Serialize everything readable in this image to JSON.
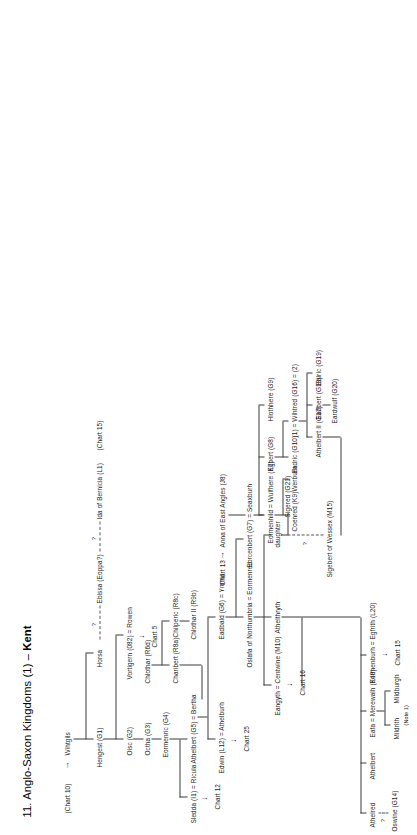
{
  "chart": {
    "title_prefix": "11. Anglo-Saxon Kingdoms (1) – ",
    "title_kingdom": "Kent",
    "full_title": "11. Anglo-Saxon Kingdoms (1) – Kent"
  },
  "nodes": {
    "chart10": "(Chart 10)",
    "wihtgils": "Wihtgils",
    "hengest": "Hengest (G1)",
    "horsa": "Horsa",
    "ebissa": "Ebissa (Eoppa?)",
    "ida": "Ida of Bernicia (L1)",
    "chart15_ref": "(Chart 15)",
    "oisc": "Oisc (G2)",
    "vortigern": "Vortigern (082) = Rowen",
    "chart5": "Chart 5",
    "octha": "Octha (G3)",
    "eormenric": "Eormenric (G4)",
    "sledda": "Sledda (I1) = Ricula",
    "chart12": "Chart 12",
    "athelbert_g5": "Athelbert (G5) = Bertha",
    "athelburh": "Athelburh",
    "edwin": "Edwin (L12) = Athelburh",
    "chart25": "Chart 25",
    "chlothar_r6d": "Chlothar (R6d)",
    "charibert": "Charibert (R8a)",
    "chilperic": "Chilperic (R8c)",
    "chlothar_ii": "Chlothar II (R9b)",
    "eadbald": "Eadbald (G6) = Ymme",
    "oslafa": "Oslafa of Northumbria = Eormenred",
    "athelthryth": "Athelthryth",
    "eangyth": "Eangyth = Centwine (M10)",
    "chart16": "Chart 16",
    "eorcenbert": "Eorcenbert (G7) = Seaxburh",
    "anna": "Anna of East Angles (J8)",
    "chart13": "Chart 13",
    "egbert": "Egbert (G8)",
    "hlothhere": "Hlothhere (G9)",
    "eadric": "Eadric (G10)",
    "wihtred": "(1) = Wihtred (G16) = (2)",
    "ealric": "Ealric (G19)",
    "eadbert": "Eadbert (G18)",
    "eardwulf": "Eardwulf (G20)",
    "eormenhild": "Eormenhild = Wulfhere (K7)",
    "coenred": "Coenred (K9)",
    "werburh": "Werburh",
    "athelbert_ii": "Athelbert II (G17)",
    "daughter": "daughter",
    "sigered": "Sigered (G21)",
    "sigebert": "Sigebert of Wessex (M15)",
    "athelred": "Athelred",
    "oswine": "Oswine (G14)",
    "athelbert_plain": "Athelbert",
    "eafa": "Eafa = Merewalh (K48)",
    "mildrith": "Mildrith",
    "mildburgh": "Mildburgh",
    "note1": "(Note 1)",
    "eormenburh": "Eormenburh = Egfrith (L20)",
    "chart15b": "Chart 15"
  },
  "markers": {
    "question": "?",
    "arrow": "→"
  },
  "colors": {
    "line": "#3a3a3a",
    "text": "#1a1a1a",
    "background": "#ffffff"
  }
}
